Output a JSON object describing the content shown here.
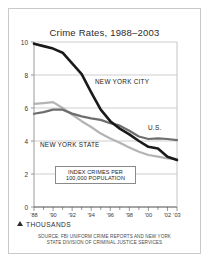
{
  "chart_data": {
    "type": "line",
    "title": "Crime Rates, 1988–2003",
    "xlabel": "",
    "ylabel": "THOUSANDS",
    "ylim": [
      0,
      10
    ],
    "xlim": [
      1988,
      2003
    ],
    "grid": true,
    "legend_position": "inline-labels",
    "ytick_labels": [
      "0",
      "2",
      "4",
      "6",
      "8",
      "10"
    ],
    "ytick_values": [
      0,
      2,
      4,
      6,
      8,
      10
    ],
    "xtick_labels": [
      "'88",
      "'90",
      "'92",
      "'94",
      "'96",
      "'98",
      "'00",
      "'02",
      "'03"
    ],
    "xtick_values": [
      1988,
      1990,
      1992,
      1994,
      1996,
      1998,
      2000,
      2002,
      2003
    ],
    "x": [
      1988,
      1989,
      1990,
      1991,
      1992,
      1993,
      1994,
      1995,
      1996,
      1997,
      1998,
      1999,
      2000,
      2001,
      2002,
      2003
    ],
    "series": [
      {
        "name": "NEW YORK CITY",
        "color": "#1a1a1a",
        "width": 2.6,
        "values": [
          9.9,
          9.75,
          9.6,
          9.35,
          8.7,
          8.05,
          6.95,
          5.9,
          5.2,
          4.75,
          4.4,
          4.0,
          3.65,
          3.55,
          3.05,
          2.85
        ]
      },
      {
        "name": "U.S.",
        "color": "#6e6e6e",
        "width": 2.2,
        "values": [
          5.65,
          5.75,
          5.9,
          5.9,
          5.66,
          5.49,
          5.37,
          5.28,
          5.08,
          4.93,
          4.62,
          4.27,
          4.12,
          4.16,
          4.12,
          4.05
        ]
      },
      {
        "name": "NEW YORK STATE",
        "color": "#b4b4b4",
        "width": 2.2,
        "values": [
          6.25,
          6.3,
          6.36,
          6.0,
          5.6,
          5.2,
          4.85,
          4.45,
          4.15,
          3.9,
          3.6,
          3.35,
          3.15,
          3.05,
          2.95,
          2.9
        ]
      }
    ],
    "annotations": [
      {
        "name": "index-crimes-note",
        "line1": "INDEX CRIMES PER",
        "line2": "100,000 POPULATION"
      }
    ],
    "axis_note": "THOUSANDS",
    "source_line1": "SOURCE: FBI UNIFORM CRIME REPORTS AND NEW YORK",
    "source_line2": "STATE DIVISION OF CRIMINAL JUSTICE SERVICES"
  }
}
